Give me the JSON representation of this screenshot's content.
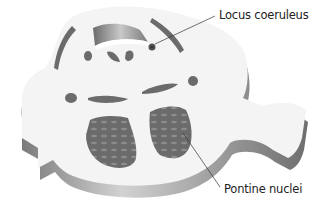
{
  "figure": {
    "labels": {
      "locus_coeruleus": "Locus coeruleus",
      "pontine_nuclei": "Pontine nuclei"
    }
  },
  "colors": {
    "background": "#ffffff",
    "surface": "#f4f4f4",
    "side_dark": "#6e6e6e",
    "side_light": "#c8c8c8",
    "nuclei_fill": "#6b6b6b",
    "nuclei_dots": "#8a8a8a",
    "leader_line": "#333333"
  }
}
